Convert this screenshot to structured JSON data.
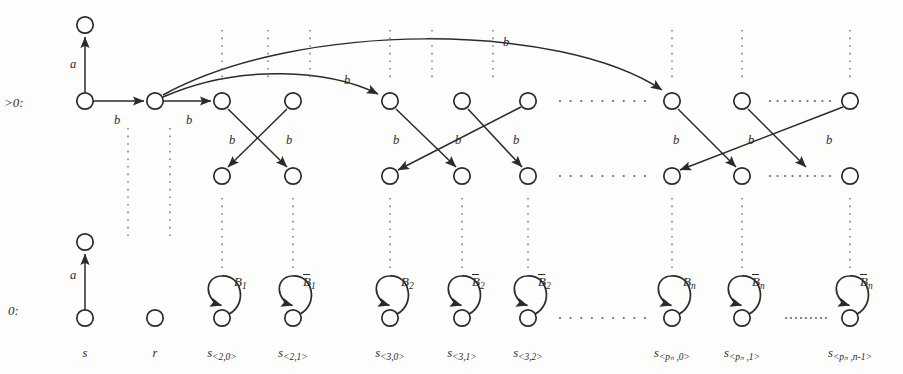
{
  "figure": {
    "kind": "automaton-transition-diagram",
    "background": "#fdfdfc",
    "ink": "#2a2a2a",
    "width": 903,
    "height": 374
  },
  "row_labels": [
    {
      "id": "row-gt0",
      "text": ">0:",
      "x": 4,
      "y": 95
    },
    {
      "id": "row-0",
      "text": "0:",
      "x": 8,
      "y": 303
    }
  ],
  "edge_labels": [
    {
      "id": "a-top",
      "text": "a",
      "x": 70,
      "y": 57
    },
    {
      "id": "b-1",
      "text": "b",
      "x": 114,
      "y": 113
    },
    {
      "id": "b-2",
      "text": "b",
      "x": 186,
      "y": 113
    },
    {
      "id": "b-3",
      "text": "b",
      "x": 229,
      "y": 133
    },
    {
      "id": "b-4",
      "text": "b",
      "x": 286,
      "y": 133
    },
    {
      "id": "b-5",
      "text": "b",
      "x": 393,
      "y": 133
    },
    {
      "id": "b-6",
      "text": "b",
      "x": 455,
      "y": 133
    },
    {
      "id": "b-7",
      "text": "b",
      "x": 513,
      "y": 133
    },
    {
      "id": "b-8",
      "text": "b",
      "x": 673,
      "y": 133
    },
    {
      "id": "b-9",
      "text": "b",
      "x": 748,
      "y": 133
    },
    {
      "id": "b-10",
      "text": "b",
      "x": 826,
      "y": 133
    },
    {
      "id": "b-arc-near",
      "text": "b",
      "x": 344,
      "y": 73
    },
    {
      "id": "b-arc-far",
      "text": "b",
      "x": 503,
      "y": 35
    },
    {
      "id": "a-bottom",
      "text": "a",
      "x": 70,
      "y": 268
    }
  ],
  "self_loops": [
    {
      "id": "loop-B1",
      "label": "B",
      "subscript": "1",
      "overbar": false,
      "cx": 222,
      "cy": 318,
      "lx": 234,
      "ly": 274
    },
    {
      "id": "loop-B1bar",
      "label": "B",
      "subscript": "1",
      "overbar": true,
      "cx": 293,
      "cy": 318,
      "lx": 303,
      "ly": 274
    },
    {
      "id": "loop-B2",
      "label": "B",
      "subscript": "2",
      "overbar": false,
      "cx": 390,
      "cy": 318,
      "lx": 401,
      "ly": 274
    },
    {
      "id": "loop-B2bar-a",
      "label": "B",
      "subscript": "2",
      "overbar": true,
      "cx": 462,
      "cy": 318,
      "lx": 472,
      "ly": 274
    },
    {
      "id": "loop-B2bar-b",
      "label": "B",
      "subscript": "2",
      "overbar": true,
      "cx": 528,
      "cy": 318,
      "lx": 538,
      "ly": 274
    },
    {
      "id": "loop-Bn",
      "label": "B",
      "subscript": "n",
      "overbar": false,
      "cx": 672,
      "cy": 318,
      "lx": 683,
      "ly": 274
    },
    {
      "id": "loop-Bnbar-a",
      "label": "B",
      "subscript": "n",
      "overbar": true,
      "cx": 742,
      "cy": 318,
      "lx": 752,
      "ly": 274
    },
    {
      "id": "loop-Bnbar-b",
      "label": "B",
      "subscript": "n",
      "overbar": true,
      "cx": 850,
      "cy": 318,
      "lx": 860,
      "ly": 274
    }
  ],
  "state_labels": [
    {
      "id": "state-s",
      "base": "s",
      "sub": "",
      "x": 85,
      "y": 346
    },
    {
      "id": "state-r",
      "base": "r",
      "sub": "",
      "x": 155,
      "y": 346
    },
    {
      "id": "state-s20",
      "base": "s",
      "sub": "<2,0>",
      "x": 222,
      "y": 346
    },
    {
      "id": "state-s21",
      "base": "s",
      "sub": "<2,1>",
      "x": 293,
      "y": 346
    },
    {
      "id": "state-s30",
      "base": "s",
      "sub": "<3,0>",
      "x": 390,
      "y": 346
    },
    {
      "id": "state-s31",
      "base": "s",
      "sub": "<3,1>",
      "x": 462,
      "y": 346
    },
    {
      "id": "state-s32",
      "base": "s",
      "sub": "<3,2>",
      "x": 528,
      "y": 346
    },
    {
      "id": "state-spn0",
      "base": "s",
      "sub": "<pₙ ,0>",
      "x": 672,
      "y": 346
    },
    {
      "id": "state-spn1",
      "base": "s",
      "sub": "<pₙ ,1>",
      "x": 742,
      "y": 346
    },
    {
      "id": "state-spnn1",
      "base": "s",
      "sub": "<pₙ ,n-1>",
      "x": 850,
      "y": 346
    }
  ],
  "columns": {
    "x_positions": [
      85,
      155,
      222,
      293,
      390,
      462,
      528,
      672,
      742,
      850
    ],
    "top_row_y": 101,
    "mid_row_y": 176,
    "bottom_row_y": 318,
    "accept_node_y": 25,
    "accept_node_y_bottom": 242
  },
  "nodes_top": [
    {
      "id": "t-0",
      "x": 85,
      "y": 101
    },
    {
      "id": "t-1",
      "x": 155,
      "y": 101
    },
    {
      "id": "t-2",
      "x": 222,
      "y": 101
    },
    {
      "id": "t-3",
      "x": 293,
      "y": 101
    },
    {
      "id": "t-4",
      "x": 390,
      "y": 101
    },
    {
      "id": "t-5",
      "x": 462,
      "y": 101
    },
    {
      "id": "t-6",
      "x": 528,
      "y": 101
    },
    {
      "id": "t-7",
      "x": 672,
      "y": 101
    },
    {
      "id": "t-8",
      "x": 742,
      "y": 101
    },
    {
      "id": "t-9",
      "x": 850,
      "y": 101
    }
  ],
  "nodes_mid": [
    {
      "id": "m-2",
      "x": 222,
      "y": 176
    },
    {
      "id": "m-3",
      "x": 293,
      "y": 176
    },
    {
      "id": "m-4",
      "x": 390,
      "y": 176
    },
    {
      "id": "m-5",
      "x": 462,
      "y": 176
    },
    {
      "id": "m-6",
      "x": 528,
      "y": 176
    },
    {
      "id": "m-7",
      "x": 672,
      "y": 176
    },
    {
      "id": "m-8",
      "x": 742,
      "y": 176
    },
    {
      "id": "m-9",
      "x": 850,
      "y": 176
    }
  ],
  "nodes_bottom": [
    {
      "id": "b-0",
      "x": 85,
      "y": 318
    },
    {
      "id": "b-1",
      "x": 155,
      "y": 318
    }
  ],
  "ellipses_horizontal": [
    {
      "id": "ell-top-1",
      "x1": 560,
      "x2": 645,
      "y": 101
    },
    {
      "id": "ell-top-2",
      "x1": 770,
      "x2": 830,
      "y": 101
    },
    {
      "id": "ell-mid-1",
      "x1": 560,
      "x2": 645,
      "y": 176
    },
    {
      "id": "ell-mid-2",
      "x1": 770,
      "x2": 830,
      "y": 176
    },
    {
      "id": "ell-bot-1",
      "x1": 560,
      "x2": 645,
      "y": 318
    },
    {
      "id": "ell-bot-2",
      "x1": 786,
      "x2": 826,
      "y": 318
    }
  ]
}
